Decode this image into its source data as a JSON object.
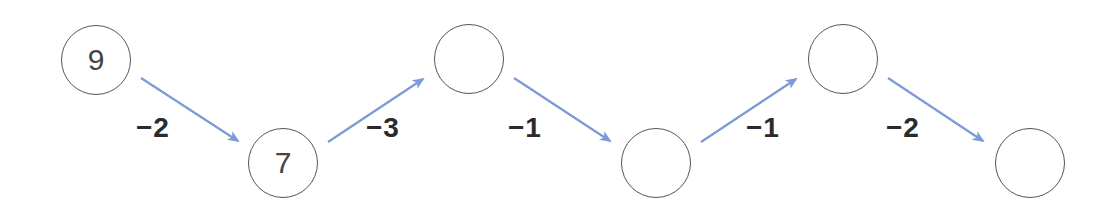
{
  "diagram": {
    "type": "number-chain",
    "arrow_color": "#7B9AD6",
    "nodes": [
      {
        "value": "9",
        "cx": 96,
        "cy": 60
      },
      {
        "value": "7",
        "cx": 283,
        "cy": 163
      },
      {
        "value": "",
        "cx": 469,
        "cy": 59
      },
      {
        "value": "",
        "cx": 656,
        "cy": 163
      },
      {
        "value": "",
        "cx": 843,
        "cy": 59
      },
      {
        "value": "",
        "cx": 1030,
        "cy": 163
      }
    ],
    "steps": [
      {
        "label": "−2",
        "x": 136,
        "y": 112
      },
      {
        "label": "−3",
        "x": 366,
        "y": 112
      },
      {
        "label": "−1",
        "x": 508,
        "y": 112
      },
      {
        "label": "−1",
        "x": 746,
        "y": 112
      },
      {
        "label": "−2",
        "x": 886,
        "y": 112
      }
    ]
  }
}
